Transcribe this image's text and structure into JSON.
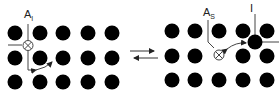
{
  "diagram": {
    "type": "lattice-defect-reaction",
    "left_panel": {
      "label_main": "A",
      "label_sub": "I",
      "description": "Substitutional A atom position vacated (vacancy marker ⊗) with interstitial arrow"
    },
    "right_panel": {
      "label_main": "A",
      "label_sub": "S",
      "interstitial_label": "I"
    },
    "reaction_arrows": "⇄",
    "colors": {
      "atom": "#000000",
      "line": "#444444",
      "background": "#ffffff"
    }
  }
}
